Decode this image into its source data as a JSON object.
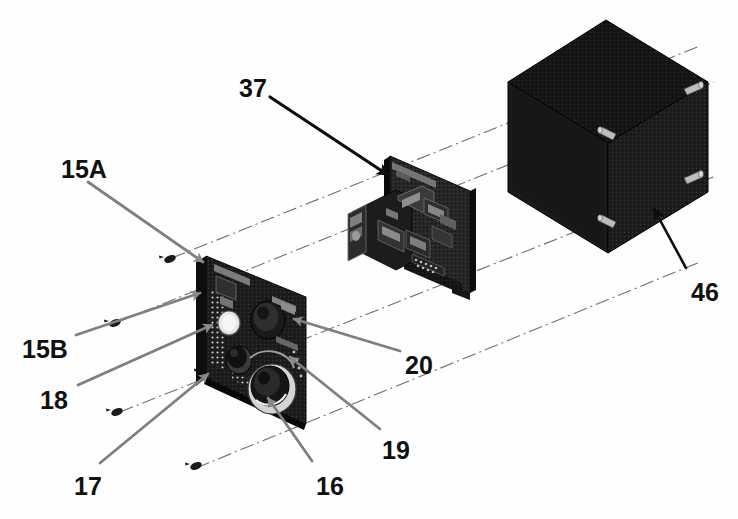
{
  "figure": {
    "kind": "patent-exploded-assembly-drawing",
    "background_color": "#ffffff",
    "ink_color": "#111111",
    "leader_gray": "#808080",
    "body_dark": "#1b1b1b",
    "standoff_gray": "#bdbdbd"
  },
  "callouts": [
    {
      "id": "37",
      "label": "37",
      "x": 239,
      "y": 76,
      "target": "rear-pcb-assembly",
      "leader": "solid-black"
    },
    {
      "id": "15A",
      "label": "15A",
      "x": 61,
      "y": 157,
      "target": "front-panel-top-corner",
      "leader": "solid-gray"
    },
    {
      "id": "15B",
      "label": "15B",
      "x": 22,
      "y": 337,
      "target": "front-panel-left-edge",
      "leader": "solid-gray"
    },
    {
      "id": "18",
      "label": "18",
      "x": 40,
      "y": 388,
      "target": "round-indicator-lamp",
      "leader": "solid-gray"
    },
    {
      "id": "17",
      "label": "17",
      "x": 74,
      "y": 474,
      "target": "small-knob",
      "leader": "solid-gray"
    },
    {
      "id": "16",
      "label": "16",
      "x": 316,
      "y": 474,
      "target": "large-rotary-connector",
      "leader": "solid-gray"
    },
    {
      "id": "19",
      "label": "19",
      "x": 382,
      "y": 438,
      "target": "front-panel-lower-right",
      "leader": "solid-gray"
    },
    {
      "id": "20",
      "label": "20",
      "x": 405,
      "y": 353,
      "target": "front-panel-right-edge",
      "leader": "solid-gray"
    },
    {
      "id": "46",
      "label": "46",
      "x": 691,
      "y": 280,
      "target": "enclosure-housing",
      "leader": "solid-black"
    }
  ],
  "parts": [
    {
      "name": "front-panel-pcb",
      "ref": "15A",
      "description": "front panel circuit board with knobs, connectors and indicator"
    },
    {
      "name": "rear-pcb-assembly",
      "ref": "37",
      "description": "stacked interior circuit board assembly with connector blocks"
    },
    {
      "name": "enclosure-housing",
      "ref": "46",
      "description": "dark rectangular enclosure box with four standoffs"
    }
  ],
  "enclosure": {
    "standoff_count": 4
  },
  "construction_lines": {
    "style": "dash-dot",
    "count": 4,
    "note": "alignment axes joining the three sub-assemblies"
  },
  "assembly_screws": {
    "count": 4,
    "note": "small fasteners shown at the ends of the dash-dot alignment axes"
  }
}
